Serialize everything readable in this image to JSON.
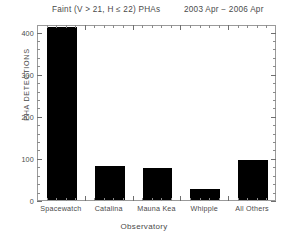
{
  "chart_data": {
    "type": "bar",
    "title": "Faint (V > 21, H ≤ 22) PHAs",
    "subtitle": "2003 Apr − 2006 Apr",
    "xlabel": "Observatory",
    "ylabel": "PHA DETECTIONS",
    "categories": [
      "Spacewatch",
      "Catalina",
      "Mauna Kea",
      "Whipple",
      "All Others"
    ],
    "values": [
      410,
      80,
      76,
      26,
      96
    ],
    "ylim": [
      0,
      418
    ],
    "xlim": [
      0,
      5
    ],
    "yticks": [
      0,
      100,
      200,
      300,
      400
    ],
    "ytick_labels": [
      "0",
      "100",
      "200",
      "300",
      "400"
    ],
    "y_minor_interval": 20,
    "grid": false,
    "legend": null,
    "bar_color": "#000000",
    "axis_color": "#9a9a9a",
    "text_color": "#4a4a4a",
    "background": "#ffffff"
  },
  "axis": {
    "ytick_0": "0",
    "ytick_1": "100",
    "ytick_2": "200",
    "ytick_3": "300",
    "ytick_4": "400"
  },
  "xcats": {
    "c0": "Spacewatch",
    "c1": "Catalina",
    "c2": "Mauna Kea",
    "c3": "Whipple",
    "c4": "All Others"
  }
}
